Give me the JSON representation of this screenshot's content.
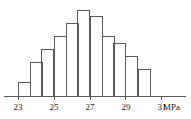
{
  "chart_data": {
    "type": "bar",
    "title": "",
    "subtitle": "",
    "xlabel": "MPa",
    "ylabel": "",
    "grid": false,
    "legend": false,
    "xlim": [
      22.67,
      31.33
    ],
    "ylim": [
      0,
      13
    ],
    "bin_width": 0.6667,
    "categories": [
      "23.00-23.67",
      "23.67-24.33",
      "24.33-25.00",
      "25.00-25.67",
      "25.67-26.33",
      "26.33-27.00",
      "27.00-27.67",
      "27.67-28.33",
      "28.33-29.00",
      "29.00-29.67",
      "29.67-30.33"
    ],
    "bin_starts": [
      23.0,
      23.667,
      24.333,
      25.0,
      25.667,
      26.333,
      27.0,
      27.667,
      28.333,
      29.0,
      29.667
    ],
    "values": [
      2,
      5,
      7,
      9,
      11,
      13,
      12,
      9,
      8,
      6,
      4
    ],
    "tick_values": [
      23,
      25,
      27,
      29,
      31
    ],
    "tick_labels": [
      "23",
      "25",
      "27",
      "29",
      "31"
    ],
    "unit_label": "MPa",
    "axis_color": "#5a5a5a",
    "bar_stroke_color": "#5a5a5a",
    "bar_fill_color": "none",
    "text_color": "#1a1a1a"
  },
  "geometry": {
    "baseline_y": 96,
    "plot_left_x": 18,
    "plot_right_x": 150,
    "axis_start_x": 4,
    "axis_end_x": 186,
    "top_y": 10,
    "bar_pixel_width": 12,
    "tick_label_y": 110,
    "tick_mark_length": 4,
    "unit_label_x": 163
  }
}
